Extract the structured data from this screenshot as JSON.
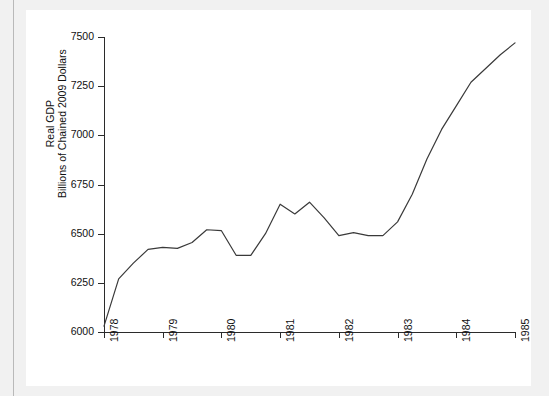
{
  "figure": {
    "background_color": "#f1f1f1",
    "card_color": "#ffffff",
    "line_color": "#3a3a3a"
  },
  "axes": {
    "y_title_line1": "Real GDP",
    "y_title_line2": "Billions of Chained 2009 Dollars",
    "y_ticks": [
      "6000",
      "6250",
      "6500",
      "6750",
      "7000",
      "7250",
      "7500"
    ],
    "x_ticks": [
      "1978",
      "1979",
      "1980",
      "1981",
      "1982",
      "1983",
      "1984",
      "1985"
    ]
  },
  "chart_data": {
    "type": "line",
    "title": "",
    "xlabel": "",
    "ylabel": "Real GDP Billions of Chained 2009 Dollars",
    "xlim": [
      1978,
      1985
    ],
    "ylim": [
      6000,
      7500
    ],
    "grid": false,
    "legend": null,
    "x_tick_values": [
      1978,
      1979,
      1980,
      1981,
      1982,
      1983,
      1984,
      1985
    ],
    "y_tick_values": [
      6000,
      6250,
      6500,
      6750,
      7000,
      7250,
      7500
    ],
    "series": [
      {
        "name": "Real GDP",
        "color": "#3a3a3a",
        "x": [
          1978.0,
          1978.25,
          1978.5,
          1978.75,
          1979.0,
          1979.25,
          1979.5,
          1979.75,
          1980.0,
          1980.25,
          1980.5,
          1980.75,
          1981.0,
          1981.25,
          1981.5,
          1981.75,
          1982.0,
          1982.25,
          1982.5,
          1982.75,
          1983.0,
          1983.25,
          1983.5,
          1983.75,
          1984.0,
          1984.25,
          1984.5,
          1984.75,
          1985.0
        ],
        "values": [
          6030,
          6270,
          6350,
          6420,
          6430,
          6425,
          6455,
          6520,
          6515,
          6390,
          6390,
          6500,
          6650,
          6600,
          6660,
          6580,
          6490,
          6505,
          6490,
          6490,
          6560,
          6700,
          6880,
          7030,
          7150,
          7270,
          7340,
          7410,
          7470
        ]
      }
    ]
  }
}
